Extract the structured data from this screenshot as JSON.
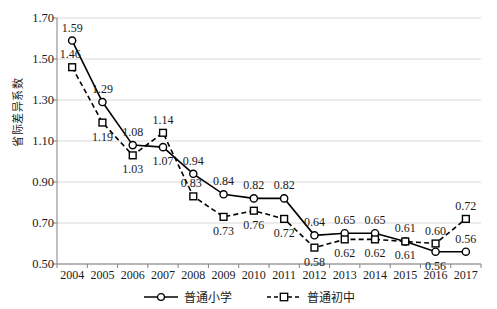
{
  "chart_data": {
    "type": "line",
    "title": "",
    "xlabel": "",
    "ylabel": "省际差异系数",
    "x": [
      "2004",
      "2005",
      "2006",
      "2007",
      "2008",
      "2009",
      "2010",
      "2011",
      "2012",
      "2013",
      "2014",
      "2015",
      "2016",
      "2017"
    ],
    "categories": [
      "2004",
      "2005",
      "2006",
      "2007",
      "2008",
      "2009",
      "2010",
      "2011",
      "2012",
      "2013",
      "2014",
      "2015",
      "2016",
      "2017"
    ],
    "ylim": [
      0.5,
      1.7
    ],
    "yticks": [
      "0.50",
      "0.70",
      "0.90",
      "1.10",
      "1.30",
      "1.50",
      "1.70"
    ],
    "ytick_values": [
      0.5,
      0.7,
      0.9,
      1.1,
      1.3,
      1.5,
      1.7
    ],
    "grid": true,
    "legend_position": "bottom",
    "series": [
      {
        "name": "普通小学",
        "marker": "circle",
        "line_style": "solid",
        "color": "#000000",
        "values": [
          1.59,
          1.29,
          1.08,
          1.07,
          0.94,
          0.84,
          0.82,
          0.82,
          0.64,
          0.65,
          0.65,
          0.61,
          0.56,
          0.56
        ],
        "labels": [
          "1.59",
          "1.29",
          "1.08",
          "1.07",
          "0.94",
          "0.84",
          "0.82",
          "0.82",
          "0.64",
          "0.65",
          "0.65",
          "0.61",
          "0.56",
          "0.56"
        ],
        "label_positions": [
          "above",
          "above",
          "above",
          "below",
          "above",
          "above",
          "above",
          "above",
          "above",
          "above",
          "above",
          "above",
          "below",
          "above"
        ]
      },
      {
        "name": "普通初中",
        "marker": "square",
        "line_style": "dashed",
        "color": "#000000",
        "values": [
          1.46,
          1.19,
          1.03,
          1.14,
          0.83,
          0.73,
          0.76,
          0.72,
          0.58,
          0.62,
          0.62,
          0.61,
          0.6,
          0.72
        ],
        "labels": [
          "1.46",
          "1.19",
          "1.03",
          "1.14",
          "0.83",
          "0.73",
          "0.76",
          "0.72",
          "0.58",
          "0.62",
          "0.62",
          "0.61",
          "0.60",
          "0.72"
        ],
        "label_positions": [
          "left",
          "below",
          "below",
          "above",
          "left",
          "below",
          "below",
          "below",
          "below",
          "below",
          "below",
          "below",
          "above",
          "above"
        ]
      }
    ]
  },
  "legend": {
    "items": [
      {
        "label": "普通小学"
      },
      {
        "label": "普通初中"
      }
    ]
  },
  "colors": {
    "line": "#000000",
    "grid": "#d9d9d9",
    "axis": "#808080",
    "background": "#ffffff"
  }
}
